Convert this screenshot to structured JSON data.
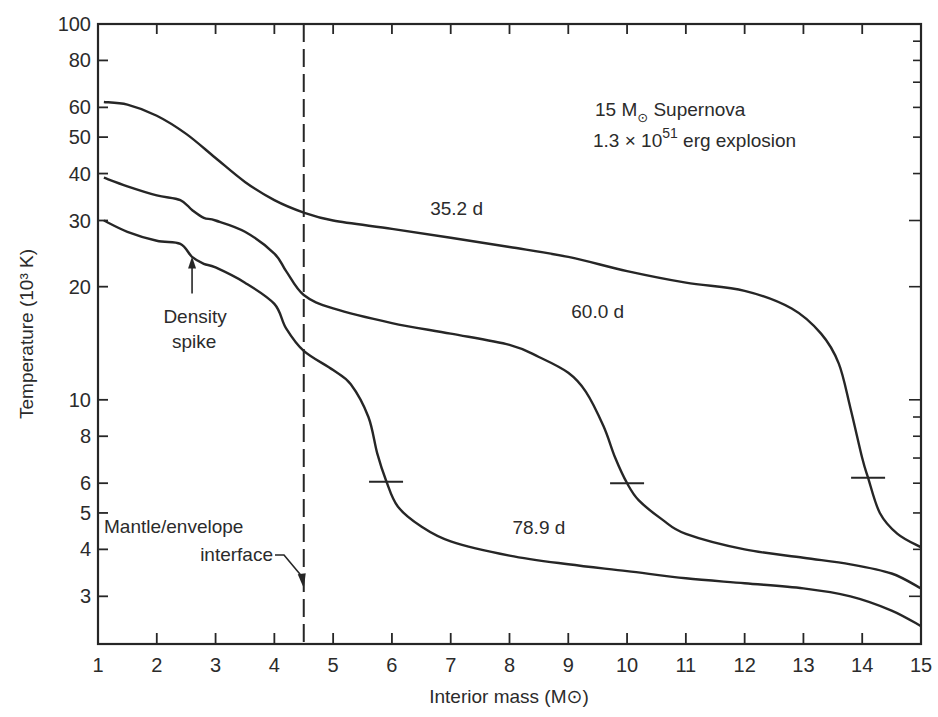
{
  "chart_data": {
    "type": "line",
    "title": "15 M⊙ Supernova",
    "subtitle": "1.3 × 10^51 erg explosion",
    "annotation_lines": [
      {
        "text_main": "15 M",
        "sub": "⊙",
        "text_after": " Supernova"
      },
      {
        "text_main": "1.3 × 10",
        "sup": "51",
        "text_after": " erg explosion"
      }
    ],
    "xlabel": "Interior mass (M⊙)",
    "ylabel": "Temperature (10³ K)",
    "xlim": [
      1,
      15
    ],
    "ylim": [
      2.24,
      100
    ],
    "yscale": "log",
    "grid": false,
    "x_ticks": [
      1,
      2,
      3,
      4,
      5,
      6,
      7,
      8,
      9,
      10,
      11,
      12,
      13,
      14,
      15
    ],
    "y_ticks": [
      3,
      4,
      5,
      6,
      8,
      10,
      20,
      30,
      40,
      50,
      60,
      80,
      100
    ],
    "y_minor_ticks_right": [
      3,
      4,
      5,
      6,
      7,
      8,
      9,
      10,
      20,
      30,
      40,
      50,
      60,
      70,
      80,
      90,
      100
    ],
    "series": [
      {
        "name": "35.2 d",
        "label_pos": [
          7.1,
          31
        ],
        "x": [
          1.1,
          1.5,
          2.0,
          2.5,
          3.0,
          3.5,
          4.0,
          4.5,
          5.0,
          6.0,
          7.0,
          8.0,
          9.0,
          10.0,
          11.0,
          12.0,
          12.8,
          13.3,
          13.6,
          13.8,
          14.0,
          14.1,
          14.3,
          14.6,
          15.0
        ],
        "y": [
          62,
          61,
          57,
          51,
          44,
          38,
          34,
          31.5,
          30,
          28.5,
          27,
          25.5,
          24,
          22,
          20.5,
          19.5,
          17.5,
          15,
          12.5,
          9.5,
          7,
          6.2,
          5,
          4.4,
          4.05
        ]
      },
      {
        "name": "60.0 d",
        "label_pos": [
          9.5,
          16.5
        ],
        "x": [
          1.1,
          1.5,
          2.0,
          2.4,
          2.6,
          2.8,
          3.0,
          3.5,
          4.0,
          4.2,
          4.5,
          5.0,
          6.0,
          7.0,
          8.0,
          8.5,
          9.0,
          9.3,
          9.6,
          9.8,
          10.0,
          10.2,
          10.6,
          11.0,
          12.0,
          13.0,
          13.8,
          14.5,
          15.0
        ],
        "y": [
          39,
          37,
          35,
          34,
          32,
          30.5,
          30,
          28,
          24.5,
          22,
          19,
          17.5,
          16,
          15,
          14,
          13,
          11.8,
          10.5,
          8.5,
          7,
          6.0,
          5.4,
          4.8,
          4.4,
          4.0,
          3.8,
          3.65,
          3.45,
          3.15
        ]
      },
      {
        "name": "78.9 d",
        "label_pos": [
          8.5,
          4.4
        ],
        "x": [
          1.1,
          1.5,
          2.0,
          2.4,
          2.6,
          2.8,
          3.0,
          3.5,
          4.0,
          4.2,
          4.5,
          5.0,
          5.3,
          5.6,
          5.75,
          5.9,
          6.1,
          6.5,
          7.0,
          8.0,
          9.0,
          10.0,
          11.0,
          12.0,
          13.0,
          13.8,
          14.5,
          15.0
        ],
        "y": [
          30,
          28,
          26.5,
          26,
          24,
          23,
          22.5,
          20.5,
          18,
          15.5,
          13.5,
          12,
          11,
          9,
          7.2,
          6.1,
          5.2,
          4.6,
          4.2,
          3.85,
          3.65,
          3.5,
          3.35,
          3.25,
          3.15,
          3.0,
          2.75,
          2.5
        ]
      }
    ],
    "ionization_markers": [
      {
        "series": "35.2 d",
        "x": 14.1,
        "y": 6.2
      },
      {
        "series": "60.0 d",
        "x": 10.0,
        "y": 6.0
      },
      {
        "series": "78.9 d",
        "x": 5.9,
        "y": 6.05
      }
    ],
    "vertical_line": {
      "x": 4.5,
      "style": "dashed",
      "label": "Mantle/envelope interface"
    },
    "annotations": [
      {
        "text": "Density",
        "text2": "spike",
        "arrow_to": [
          2.6,
          24.5
        ]
      },
      {
        "text": "Mantle/envelope",
        "text2": "interface",
        "arrow_to": [
          4.5,
          3.15
        ]
      }
    ]
  }
}
